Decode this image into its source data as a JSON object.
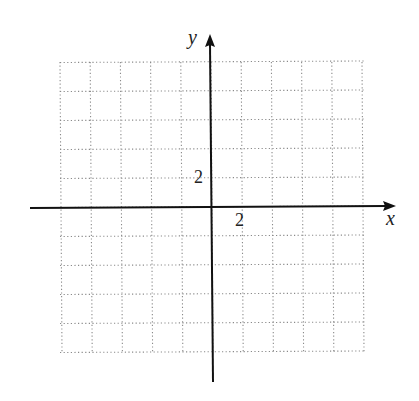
{
  "chart_data": {
    "type": "scatter",
    "title": "",
    "xlabel": "x",
    "ylabel": "y",
    "xlim": [
      -10,
      10
    ],
    "ylim": [
      -10,
      10
    ],
    "grid": true,
    "grid_style": "dotted",
    "grid_step": 2,
    "tick_labels": {
      "x": [
        {
          "value": 2,
          "label": "2"
        }
      ],
      "y": [
        {
          "value": 2,
          "label": "2"
        }
      ]
    },
    "series": []
  },
  "axes": {
    "x_label": "x",
    "y_label": "y",
    "x_tick_label": "2",
    "y_tick_label": "2"
  },
  "colors": {
    "axis": "#111111",
    "grid": "#8a8a8a",
    "text": "#222222"
  }
}
